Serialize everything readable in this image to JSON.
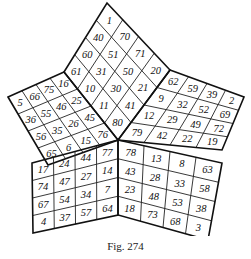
{
  "figure": {
    "caption": "Fig. 274",
    "line_color": "#111111",
    "background": "#ffffff"
  },
  "star": {
    "top_diamond": {
      "rows": [
        [
          "1"
        ],
        [
          "40",
          "70"
        ],
        [
          "60",
          "51",
          "71"
        ],
        [
          "61",
          "31",
          "50",
          "20"
        ],
        [
          "10",
          "30",
          "21"
        ],
        [
          "11",
          "41"
        ],
        [
          "80"
        ]
      ]
    },
    "left_arm": {
      "rows": [
        [
          "5",
          "66",
          "75",
          "16"
        ],
        [
          "36",
          "55",
          "46",
          "25"
        ],
        [
          "56",
          "35",
          "26",
          "45"
        ],
        [
          "65",
          "6",
          "15",
          "76"
        ]
      ]
    },
    "right_arm": {
      "rows": [
        [
          "62",
          "59",
          "39",
          "2"
        ],
        [
          "9",
          "32",
          "52",
          "69"
        ],
        [
          "12",
          "29",
          "49",
          "72"
        ],
        [
          "79",
          "42",
          "22",
          "19"
        ]
      ]
    },
    "bottom_left": {
      "rows": [
        [
          "17",
          "24",
          "44",
          "77"
        ],
        [
          "74",
          "47",
          "27",
          "14"
        ],
        [
          "67",
          "54",
          "34",
          "7"
        ],
        [
          "4",
          "37",
          "57",
          "64"
        ]
      ]
    },
    "bottom_right": {
      "rows": [
        [
          "78",
          "13",
          "8",
          "63"
        ],
        [
          "43",
          "28",
          "33",
          "58"
        ],
        [
          "23",
          "48",
          "53",
          "38"
        ],
        [
          "18",
          "73",
          "68",
          "3"
        ]
      ]
    }
  }
}
